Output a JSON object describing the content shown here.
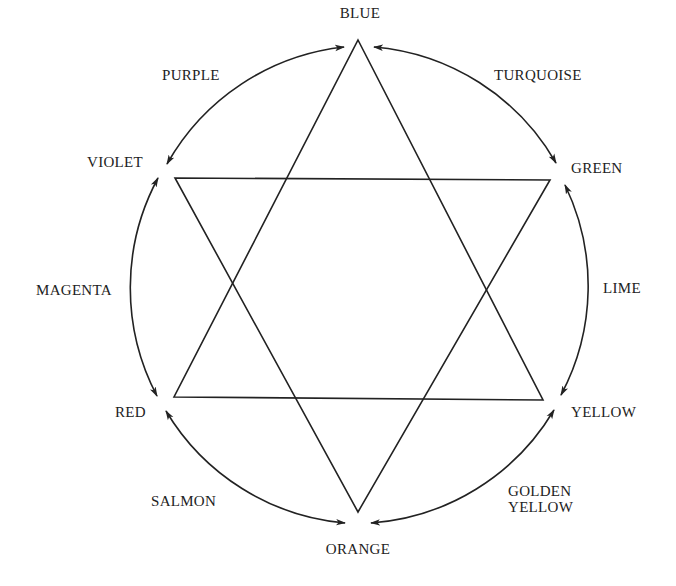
{
  "diagram": {
    "colors": {
      "line": "#222222",
      "text": "#222222",
      "background": "#ffffff"
    },
    "primary_nodes": [
      {
        "id": "blue",
        "label": "BLUE"
      },
      {
        "id": "green",
        "label": "GREEN"
      },
      {
        "id": "yellow",
        "label": "YELLOW"
      },
      {
        "id": "orange",
        "label": "ORANGE"
      },
      {
        "id": "red",
        "label": "RED"
      },
      {
        "id": "violet",
        "label": "VIOLET"
      }
    ],
    "intermediate_labels": [
      {
        "id": "turquoise",
        "label": "TURQUOISE",
        "between": [
          "blue",
          "green"
        ]
      },
      {
        "id": "lime",
        "label": "LIME",
        "between": [
          "green",
          "yellow"
        ]
      },
      {
        "id": "golden-yellow",
        "label_line1": "GOLDEN",
        "label_line2": "YELLOW",
        "between": [
          "yellow",
          "orange"
        ]
      },
      {
        "id": "salmon",
        "label": "SALMON",
        "between": [
          "orange",
          "red"
        ]
      },
      {
        "id": "magenta",
        "label": "MAGENTA",
        "between": [
          "red",
          "violet"
        ]
      },
      {
        "id": "purple",
        "label": "PURPLE",
        "between": [
          "violet",
          "blue"
        ]
      }
    ],
    "triangles": [
      {
        "name": "triangle-blue-yellow-red",
        "vertices": [
          "blue",
          "yellow",
          "red"
        ]
      },
      {
        "name": "triangle-violet-green-orange",
        "vertices": [
          "violet",
          "green",
          "orange"
        ]
      }
    ],
    "arrows": "double-headed arcs connecting each adjacent pair of primary nodes around a circle"
  }
}
